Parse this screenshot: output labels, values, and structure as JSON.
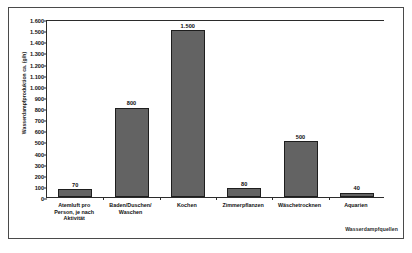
{
  "chart_data": {
    "type": "bar",
    "title": "",
    "subtitle": "",
    "xlabel": "Wasserdampfquellen",
    "ylabel": "Wasserdampfproduktion ca. (g/h)",
    "categories": [
      "Atemluft pro\nPerson, je nach\nAktivität",
      "Baden/Duschen/\nWaschen",
      "Kochen",
      "Zimmerpflanzen",
      "Wäschetrocknen",
      "Aquarien"
    ],
    "category_lines": [
      [
        "Atemluft pro",
        "Person, je nach",
        "Aktivität"
      ],
      [
        "Baden/Duschen/",
        "Waschen"
      ],
      [
        "Kochen"
      ],
      [
        "Zimmerpflanzen"
      ],
      [
        "Wäschetrocknen"
      ],
      [
        "Aquarien"
      ]
    ],
    "values": [
      70,
      800,
      1500,
      80,
      500,
      40
    ],
    "value_labels": [
      "70",
      "800",
      "1.500",
      "80",
      "500",
      "40"
    ],
    "ylim": [
      0,
      1600
    ],
    "ytick_step": 100,
    "ytick_labels": [
      "1.600",
      "1.500",
      "1.400",
      "1.300",
      "1.200",
      "1.100",
      "1.000",
      "900",
      "800",
      "700",
      "600",
      "500",
      "400",
      "300",
      "200",
      "100",
      "0"
    ],
    "ytick_values": [
      1600,
      1500,
      1400,
      1300,
      1200,
      1100,
      1000,
      900,
      800,
      700,
      600,
      500,
      400,
      300,
      200,
      100,
      0
    ],
    "grid": false,
    "legend": false,
    "legend_position": "none",
    "colors": {
      "bar_fill": "#636363",
      "bar_edge": "#1e1e1e",
      "axis": "#2b2b2b",
      "text": "#111111",
      "frame": "#4a4a4a",
      "background": "#ffffff"
    }
  }
}
